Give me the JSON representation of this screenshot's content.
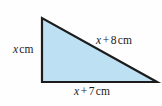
{
  "figure": {
    "kind": "right-triangle-geometry-diagram",
    "colors": {
      "fill": "#bde0f2",
      "stroke": "#1c1c1c",
      "background": "#fefefe",
      "text": "#1a1a1a"
    },
    "triangle": {
      "vertices": {
        "top_left": [
          42,
          18
        ],
        "bottom_left": [
          42,
          82
        ],
        "bottom_right": [
          157,
          82
        ]
      },
      "points_attr": "42,18 42,82 157,82"
    },
    "labels": {
      "left_side": {
        "variable": "x",
        "unit": "cm",
        "full_text": "x cm"
      },
      "hypotenuse": {
        "variable": "x",
        "operator": "+",
        "number": "8",
        "unit": "cm",
        "full_text": "x + 8 cm"
      },
      "bottom_side": {
        "variable": "x",
        "operator": "+",
        "number": "7",
        "unit": "cm",
        "full_text": "x + 7 cm"
      }
    }
  }
}
